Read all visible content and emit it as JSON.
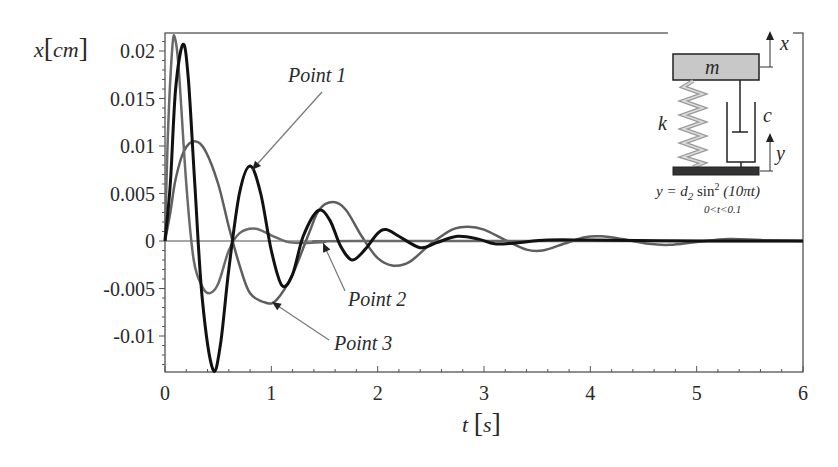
{
  "chart_data": {
    "type": "line",
    "title": "",
    "xlabel": "t [s]",
    "ylabel": "x [cm]",
    "xlim": [
      0,
      6
    ],
    "ylim": [
      -0.0138,
      0.0219
    ],
    "grid": false,
    "legend": "none (curves labelled with arrow annotations)",
    "x_ticks": [
      0,
      1,
      2,
      3,
      4,
      5,
      6
    ],
    "x_tick_labels": [
      "0",
      "1",
      "2",
      "3",
      "4",
      "5",
      "6"
    ],
    "y_ticks": [
      0.02,
      0.015,
      0.01,
      0.005,
      0,
      -0.005,
      -0.01
    ],
    "y_tick_labels": [
      "0.02",
      "0.015",
      "0.01",
      "0.005",
      "0",
      "-0.005",
      "-0.01"
    ],
    "series": [
      {
        "name": "Point 1",
        "color": "#111111",
        "width": 3,
        "t": [
          0,
          0.05,
          0.1,
          0.17,
          0.22,
          0.28,
          0.35,
          0.45,
          0.52,
          0.6,
          0.7,
          0.8,
          0.9,
          1.0,
          1.1,
          1.2,
          1.3,
          1.44,
          1.55,
          1.65,
          1.76,
          1.88,
          2.0,
          2.08,
          2.2,
          2.4,
          2.55,
          2.75,
          2.95,
          3.1,
          3.3,
          3.6,
          4.0,
          5.0,
          6.0
        ],
        "x": [
          0,
          0.006,
          0.016,
          0.0207,
          0.017,
          0.006,
          -0.006,
          -0.0135,
          -0.011,
          -0.003,
          0.005,
          0.0079,
          0.005,
          -0.001,
          -0.0047,
          -0.0035,
          0.0005,
          0.0032,
          0.0022,
          -0.0005,
          -0.002,
          -0.0009,
          0.0008,
          0.0012,
          0.0005,
          -0.0007,
          -0.0002,
          0.0005,
          0.0002,
          -0.0003,
          -0.0002,
          0.0001,
          0.0001,
          0,
          0
        ]
      },
      {
        "name": "Point 2",
        "color": "#6a6a6a",
        "width": 2.5,
        "t": [
          0,
          0.03,
          0.07,
          0.095,
          0.13,
          0.2,
          0.27,
          0.35,
          0.42,
          0.5,
          0.6,
          0.7,
          0.85,
          1.0,
          1.15,
          1.3,
          1.5,
          1.8,
          6.0
        ],
        "x": [
          0,
          0.012,
          0.0205,
          0.0213,
          0.018,
          0.006,
          -0.002,
          -0.0048,
          -0.0055,
          -0.0045,
          -0.001,
          0.0008,
          0.0013,
          0.0006,
          -0.0001,
          -0.0002,
          -0.0001,
          0,
          0
        ]
      },
      {
        "name": "Point 3",
        "color": "#5e5e5e",
        "width": 2.5,
        "t": [
          0,
          0.05,
          0.1,
          0.18,
          0.28,
          0.38,
          0.5,
          0.6,
          0.7,
          0.8,
          0.95,
          1.05,
          1.2,
          1.35,
          1.45,
          1.58,
          1.7,
          1.85,
          2.0,
          2.15,
          2.3,
          2.5,
          2.7,
          2.85,
          3.0,
          3.2,
          3.4,
          3.55,
          3.75,
          3.95,
          4.1,
          4.3,
          4.55,
          4.75,
          5.0,
          5.3,
          5.6,
          6.0
        ],
        "x": [
          0,
          0.003,
          0.0065,
          0.0095,
          0.0105,
          0.0095,
          0.006,
          0.0015,
          -0.0025,
          -0.0055,
          -0.0065,
          -0.0062,
          -0.0035,
          0.0007,
          0.0033,
          0.0041,
          0.0033,
          0.0005,
          -0.0018,
          -0.0026,
          -0.0022,
          -0.0003,
          0.0012,
          0.0015,
          0.0012,
          0.0001,
          -0.0009,
          -0.001,
          -0.0003,
          0.0004,
          0.0005,
          0.0002,
          -0.0003,
          -0.0004,
          -0.0001,
          0.0002,
          0.0001,
          0
        ]
      }
    ],
    "annotations": [
      {
        "text": "Point 1",
        "label_xy": [
          288,
          82
        ],
        "arrow_from": [
          322,
          92
        ],
        "arrow_to": [
          252,
          170
        ]
      },
      {
        "text": "Point 2",
        "label_xy": [
          348,
          306
        ],
        "arrow_from": [
          345,
          291
        ],
        "arrow_to": [
          323,
          243
        ]
      },
      {
        "text": "Point 3",
        "label_xy": [
          334,
          350
        ],
        "arrow_from": [
          329,
          340
        ],
        "arrow_to": [
          272,
          302
        ]
      }
    ],
    "inset": {
      "description": "Mass-spring-damper with base excitation",
      "mass_label": "m",
      "spring_label": "k",
      "damper_label": "c",
      "mass_displacement_label": "x",
      "base_displacement_label": "y",
      "equation": "y = d₂ sin² (10πt)",
      "equation_parts": {
        "lhs": "y = d",
        "sub": "2",
        "fn": " sin",
        "sup": "2",
        "arg": " (10πt)"
      },
      "condition": "0<t<0.1"
    }
  }
}
